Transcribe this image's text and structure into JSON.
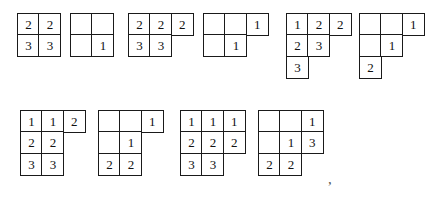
{
  "figure": {
    "caption_mark": ",",
    "cell_size_px": 23,
    "border_color": "#1a1a1a",
    "text_color": "#111111",
    "background": "#ffffff",
    "tableaux": [
      {
        "id": "tableau-1",
        "x": 17,
        "y": 13,
        "rows": [
          [
            "2",
            "2"
          ],
          [
            "3",
            "3"
          ]
        ]
      },
      {
        "id": "tableau-2",
        "x": 70,
        "y": 13,
        "rows": [
          [
            "",
            ""
          ],
          [
            "",
            "1"
          ]
        ]
      },
      {
        "id": "tableau-3",
        "x": 128,
        "y": 13,
        "rows": [
          [
            "2",
            "2",
            "2"
          ],
          [
            "3",
            "3"
          ]
        ]
      },
      {
        "id": "tableau-4",
        "x": 203,
        "y": 13,
        "rows": [
          [
            "",
            "",
            "1"
          ],
          [
            "",
            "1"
          ]
        ]
      },
      {
        "id": "tableau-5",
        "x": 286,
        "y": 13,
        "rows": [
          [
            "1",
            "2",
            "2"
          ],
          [
            "2",
            "3"
          ],
          [
            "3"
          ]
        ]
      },
      {
        "id": "tableau-6",
        "x": 359,
        "y": 13,
        "rows": [
          [
            "",
            "",
            "1"
          ],
          [
            "",
            "1"
          ],
          [
            "2"
          ]
        ]
      },
      {
        "id": "tableau-7",
        "x": 20,
        "y": 110,
        "rows": [
          [
            "1",
            "1",
            "2"
          ],
          [
            "2",
            "2"
          ],
          [
            "3",
            "3"
          ]
        ]
      },
      {
        "id": "tableau-8",
        "x": 98,
        "y": 110,
        "rows": [
          [
            "",
            "",
            "1"
          ],
          [
            "",
            "1"
          ],
          [
            "2",
            "2"
          ]
        ]
      },
      {
        "id": "tableau-9",
        "x": 180,
        "y": 110,
        "rows": [
          [
            "1",
            "1",
            "1"
          ],
          [
            "2",
            "2",
            "2"
          ],
          [
            "3",
            "3"
          ]
        ]
      },
      {
        "id": "tableau-10",
        "x": 258,
        "y": 110,
        "rows": [
          [
            "",
            "",
            "1"
          ],
          [
            "",
            "1",
            "3"
          ],
          [
            "2",
            "2"
          ]
        ]
      }
    ],
    "comma": {
      "x": 328,
      "y": 172,
      "text": ","
    }
  }
}
